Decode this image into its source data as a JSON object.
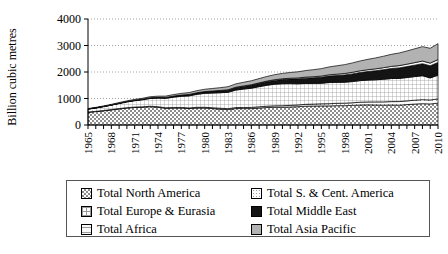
{
  "chart_data": {
    "type": "area",
    "stacked": true,
    "title": "",
    "xlabel": "",
    "ylabel": "Billion cubic metres",
    "ylim": [
      0,
      4000
    ],
    "yticks": [
      0,
      1000,
      2000,
      3000,
      4000
    ],
    "grid": true,
    "legend_position": "bottom",
    "x": [
      1965,
      1966,
      1967,
      1968,
      1969,
      1970,
      1971,
      1972,
      1973,
      1974,
      1975,
      1976,
      1977,
      1978,
      1979,
      1980,
      1981,
      1982,
      1983,
      1984,
      1985,
      1986,
      1987,
      1988,
      1989,
      1990,
      1991,
      1992,
      1993,
      1994,
      1995,
      1996,
      1997,
      1998,
      1999,
      2000,
      2001,
      2002,
      2003,
      2004,
      2005,
      2006,
      2007,
      2008,
      2009,
      2010
    ],
    "xtick_labels": [
      "1965",
      "1968",
      "1971",
      "1974",
      "1977",
      "1980",
      "1983",
      "1986",
      "1989",
      "1992",
      "1995",
      "1998",
      "2001",
      "2004",
      "2007",
      "2010"
    ],
    "series": [
      {
        "name": "Total North America",
        "pattern": "dense-check",
        "color": "#9a9a9a",
        "values": [
          480,
          505,
          535,
          570,
          605,
          640,
          660,
          670,
          690,
          670,
          630,
          640,
          640,
          620,
          640,
          640,
          620,
          600,
          580,
          620,
          620,
          620,
          640,
          660,
          670,
          670,
          680,
          690,
          710,
          715,
          720,
          720,
          730,
          730,
          740,
          755,
          760,
          755,
          750,
          755,
          750,
          770,
          790,
          805,
          795,
          825
        ]
      },
      {
        "name": "Total S. & Cent. America",
        "pattern": "sparse-dot",
        "color": "#efefef",
        "values": [
          10,
          11,
          12,
          13,
          14,
          15,
          16,
          17,
          18,
          19,
          20,
          21,
          23,
          25,
          27,
          29,
          31,
          33,
          35,
          38,
          41,
          44,
          47,
          50,
          54,
          58,
          62,
          66,
          70,
          74,
          79,
          84,
          89,
          94,
          99,
          105,
          110,
          116,
          122,
          128,
          134,
          140,
          146,
          152,
          150,
          158
        ]
      },
      {
        "name": "Total Europe & Eurasia",
        "pattern": "grid-lines",
        "color": "#dcdcdc",
        "values": [
          110,
          125,
          145,
          165,
          190,
          215,
          240,
          265,
          295,
          325,
          355,
          390,
          420,
          455,
          490,
          525,
          555,
          585,
          620,
          660,
          695,
          725,
          760,
          790,
          815,
          830,
          820,
          800,
          790,
          780,
          775,
          800,
          790,
          790,
          800,
          815,
          825,
          835,
          855,
          870,
          875,
          880,
          890,
          905,
          830,
          900
        ]
      },
      {
        "name": "Total Middle East",
        "pattern": "solid-black",
        "color": "#111111",
        "values": [
          5,
          6,
          7,
          8,
          10,
          12,
          14,
          17,
          20,
          24,
          28,
          33,
          38,
          44,
          50,
          57,
          64,
          72,
          80,
          90,
          100,
          110,
          120,
          132,
          144,
          157,
          170,
          184,
          198,
          212,
          227,
          242,
          258,
          274,
          290,
          307,
          324,
          342,
          360,
          378,
          396,
          414,
          432,
          450,
          460,
          480
        ]
      },
      {
        "name": "Total Africa",
        "pattern": "thin-line",
        "color": "#f7f7f7",
        "values": [
          1,
          1,
          2,
          2,
          3,
          3,
          4,
          4,
          5,
          5,
          6,
          7,
          8,
          9,
          10,
          11,
          12,
          14,
          15,
          17,
          19,
          21,
          23,
          25,
          28,
          30,
          33,
          36,
          39,
          42,
          45,
          48,
          52,
          56,
          60,
          64,
          68,
          72,
          76,
          81,
          86,
          91,
          96,
          101,
          100,
          106
        ]
      },
      {
        "name": "Total Asia Pacific",
        "pattern": "mid-grey",
        "color": "#b4b4b4",
        "values": [
          14,
          16,
          18,
          21,
          24,
          27,
          31,
          35,
          40,
          45,
          51,
          57,
          64,
          71,
          79,
          87,
          96,
          105,
          115,
          126,
          137,
          149,
          161,
          174,
          188,
          202,
          217,
          232,
          248,
          264,
          281,
          298,
          316,
          334,
          353,
          372,
          392,
          412,
          433,
          454,
          476,
          498,
          521,
          544,
          560,
          600
        ]
      }
    ]
  },
  "legend": {
    "entries": [
      {
        "label": "Total North America",
        "swatch": "dense-check-swatch"
      },
      {
        "label": "Total S. & Cent. America",
        "swatch": "sparse-dot-swatch"
      },
      {
        "label": "Total Europe & Eurasia",
        "swatch": "grid-lines-swatch"
      },
      {
        "label": "Total Middle East",
        "swatch": "solid-black-swatch"
      },
      {
        "label": "Total Africa",
        "swatch": "thin-line-swatch"
      },
      {
        "label": "Total Asia Pacific",
        "swatch": "mid-grey-swatch"
      }
    ]
  }
}
